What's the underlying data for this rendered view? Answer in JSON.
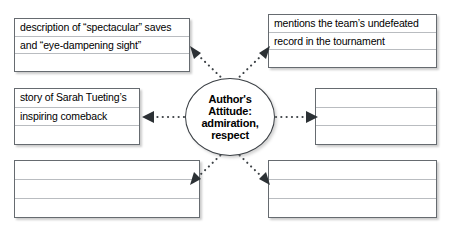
{
  "diagram": {
    "center": {
      "name": "center-oval",
      "lines": [
        "Author's",
        "Attitude:",
        "admiration,",
        "respect"
      ]
    },
    "boxes": [
      {
        "id": "top-left",
        "position": "top-left",
        "rows": [
          "description of “spectacular” saves",
          "and “eye-dampening sight”",
          ""
        ]
      },
      {
        "id": "top-right",
        "position": "top-right",
        "rows": [
          "mentions the team’s undefeated",
          "record in the tournament",
          ""
        ]
      },
      {
        "id": "mid-left",
        "position": "middle-left",
        "rows": [
          "story of Sarah Tueting’s",
          "inspiring comeback",
          ""
        ]
      },
      {
        "id": "mid-right",
        "position": "middle-right",
        "rows": [
          "",
          "",
          ""
        ]
      },
      {
        "id": "bottom-left",
        "position": "bottom-left",
        "rows": [
          "",
          "",
          ""
        ]
      },
      {
        "id": "bottom-right",
        "position": "bottom-right",
        "rows": [
          "",
          "",
          ""
        ]
      }
    ],
    "connectors": [
      {
        "id": "to-top-left",
        "style": "dotted-arrow",
        "direction": "up-left"
      },
      {
        "id": "to-top-right",
        "style": "dotted-arrow",
        "direction": "up-right"
      },
      {
        "id": "to-mid-left",
        "style": "dotted-arrow",
        "direction": "left"
      },
      {
        "id": "to-mid-right",
        "style": "dotted-arrow",
        "direction": "right"
      },
      {
        "id": "to-bottom-left",
        "style": "dotted-arrow",
        "direction": "down-left"
      },
      {
        "id": "to-bottom-right",
        "style": "dotted-arrow",
        "direction": "down-right"
      }
    ],
    "colors": {
      "background": "#ffffff",
      "box_border": "#666b70",
      "rule_line": "#b9bcc0",
      "oval_border": "#3a3f44",
      "connector": "#3d4246",
      "text": "#000000"
    }
  }
}
